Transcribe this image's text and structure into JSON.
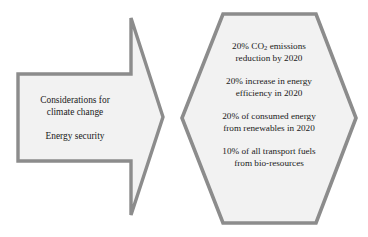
{
  "diagram": {
    "type": "flow-diagram",
    "palette": {
      "shape_fill": "#f2f2f2",
      "shape_border": "#8c8c8c",
      "text_color": "#1a1a1a",
      "background": "#ffffff"
    },
    "arrow": {
      "shape": "right-block-arrow",
      "paragraphs": [
        {
          "lines": [
            "Considerations for",
            "climate change"
          ]
        },
        {
          "lines": [
            "Energy security"
          ]
        }
      ]
    },
    "hexagon": {
      "shape": "hexagon",
      "paragraphs": [
        {
          "lines": [
            "20% CO2 emissions",
            "reduction by 2020"
          ],
          "subscript_line": 0
        },
        {
          "lines": [
            "20% increase in energy",
            "efficiency in 2020"
          ]
        },
        {
          "lines": [
            "20% of consumed energy",
            "from renewables in 2020"
          ]
        },
        {
          "lines": [
            "10% of all transport fuels",
            "from bio-resources"
          ]
        }
      ]
    },
    "targets": {
      "co2_prefix": "20% CO",
      "co2_sub": "2",
      "co2_suffix": " emissions",
      "co2_line2": "reduction by 2020",
      "efficiency_line1": "20% increase in energy",
      "efficiency_line2": "efficiency in 2020",
      "renewables_line1": "20% of consumed energy",
      "renewables_line2": "from renewables in 2020",
      "biofuel_line1": "10% of all transport fuels",
      "biofuel_line2": "from bio-resources"
    },
    "drivers": {
      "climate_line1": "Considerations for",
      "climate_line2": "climate change",
      "security_line1": "Energy security"
    }
  }
}
